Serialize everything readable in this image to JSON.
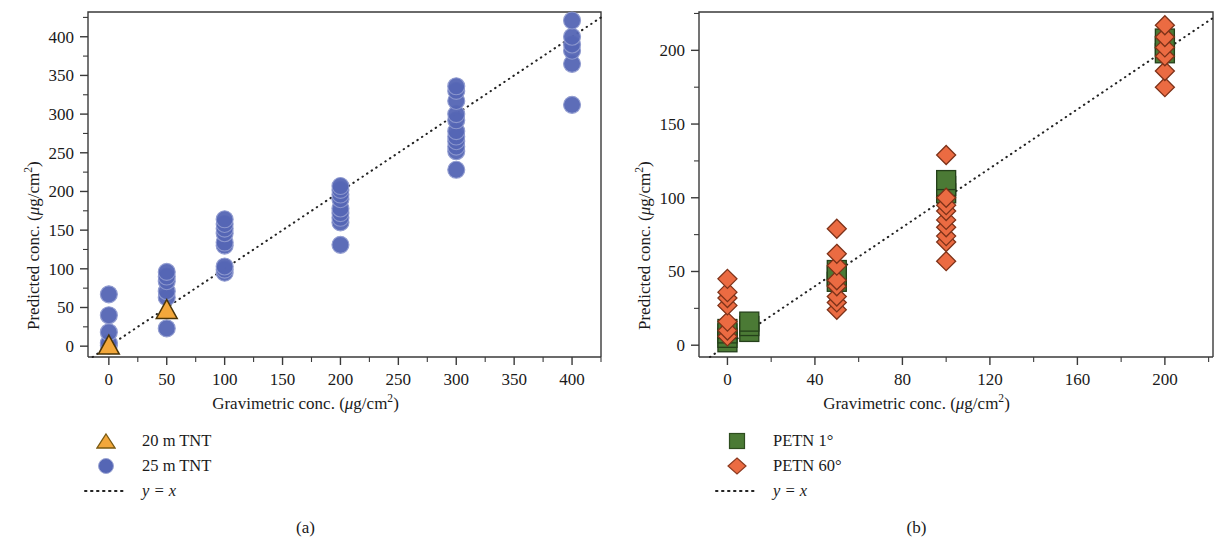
{
  "figure": {
    "panels": [
      {
        "id": "a",
        "caption": "(a)",
        "x_axis_label": "Gravimetric conc. (μg/cm²)",
        "y_axis_label": "Predicted conc. (μg/cm²)",
        "legend": [
          {
            "key": "triangle",
            "label": "20 m TNT",
            "color": "#F2A73B"
          },
          {
            "key": "circle",
            "label": "25 m TNT",
            "color": "#5566B5"
          },
          {
            "key": "dotted-line",
            "label": "y = x",
            "color": "#222222"
          }
        ]
      },
      {
        "id": "b",
        "caption": "(b)",
        "x_axis_label": "Gravimetric conc. (μg/cm²)",
        "y_axis_label": "Predicted conc. (μg/cm²)",
        "legend": [
          {
            "key": "square",
            "label": "PETN 1°",
            "color": "#4B7A35"
          },
          {
            "key": "diamond",
            "label": "PETN 60°",
            "color": "#EB6B42"
          },
          {
            "key": "dotted-line",
            "label": "y = x",
            "color": "#222222"
          }
        ]
      }
    ]
  },
  "chart_data": [
    {
      "type": "scatter",
      "panel": "a",
      "title": "",
      "xlabel": "Gravimetric conc. (μg/cm²)",
      "ylabel": "Predicted conc. (μg/cm²)",
      "xlim": [
        -18,
        425
      ],
      "ylim": [
        -14,
        432
      ],
      "xticks": [
        0,
        50,
        100,
        150,
        200,
        250,
        300,
        350,
        400
      ],
      "yticks": [
        0,
        50,
        100,
        150,
        200,
        250,
        300,
        350,
        400
      ],
      "xtick_minor_step": 25,
      "ytick_minor_step": 25,
      "grid": false,
      "legend_position": "below-left",
      "reference_line": {
        "label": "y = x",
        "style": "dotted",
        "slope": 1,
        "intercept": 0
      },
      "series": [
        {
          "name": "25 m TNT",
          "marker": "circle",
          "color": "#5566B5",
          "points": [
            [
              0,
              1
            ],
            [
              0,
              4
            ],
            [
              0,
              18
            ],
            [
              0,
              40
            ],
            [
              0,
              67
            ],
            [
              50,
              23
            ],
            [
              50,
              63
            ],
            [
              50,
              71
            ],
            [
              50,
              84
            ],
            [
              50,
              90
            ],
            [
              50,
              96
            ],
            [
              100,
              95
            ],
            [
              100,
              99
            ],
            [
              100,
              103
            ],
            [
              100,
              130
            ],
            [
              100,
              134
            ],
            [
              100,
              146
            ],
            [
              100,
              152
            ],
            [
              100,
              158
            ],
            [
              100,
              164
            ],
            [
              200,
              131
            ],
            [
              200,
              160
            ],
            [
              200,
              166
            ],
            [
              200,
              172
            ],
            [
              200,
              178
            ],
            [
              200,
              190
            ],
            [
              200,
              196
            ],
            [
              200,
              202
            ],
            [
              200,
              207
            ],
            [
              300,
              228
            ],
            [
              300,
              252
            ],
            [
              300,
              258
            ],
            [
              300,
              265
            ],
            [
              300,
              271
            ],
            [
              300,
              278
            ],
            [
              300,
              292
            ],
            [
              300,
              300
            ],
            [
              300,
              317
            ],
            [
              300,
              330
            ],
            [
              300,
              336
            ],
            [
              400,
              312
            ],
            [
              400,
              365
            ],
            [
              400,
              382
            ],
            [
              400,
              390
            ],
            [
              400,
              400
            ],
            [
              400,
              421
            ]
          ]
        },
        {
          "name": "20 m TNT",
          "marker": "triangle",
          "color": "#F2A73B",
          "points": [
            [
              0,
              0
            ],
            [
              50,
              46
            ]
          ]
        }
      ]
    },
    {
      "type": "scatter",
      "panel": "b",
      "title": "",
      "xlabel": "Gravimetric conc. (μg/cm²)",
      "ylabel": "Predicted conc. (μg/cm²)",
      "xlim": [
        -13,
        222
      ],
      "ylim": [
        -8,
        226
      ],
      "xticks": [
        0,
        40,
        80,
        120,
        160,
        200
      ],
      "yticks": [
        0,
        50,
        100,
        150,
        200
      ],
      "xtick_minor_step": 20,
      "ytick_minor_step": 25,
      "grid": false,
      "legend_position": "below-right",
      "reference_line": {
        "label": "y = x",
        "style": "dotted",
        "slope": 1,
        "intercept": 0
      },
      "series": [
        {
          "name": "PETN 1°",
          "marker": "square",
          "color": "#4B7A35",
          "points": [
            [
              0,
              2
            ],
            [
              0,
              5
            ],
            [
              0,
              8
            ],
            [
              0,
              11
            ],
            [
              10,
              9
            ],
            [
              10,
              13
            ],
            [
              10,
              16
            ],
            [
              50,
              43
            ],
            [
              50,
              47
            ],
            [
              50,
              51
            ],
            [
              100,
              103
            ],
            [
              100,
              108
            ],
            [
              100,
              112
            ],
            [
              200,
              198
            ],
            [
              200,
              203
            ],
            [
              200,
              208
            ]
          ]
        },
        {
          "name": "PETN 60°",
          "marker": "diamond",
          "color": "#EB6B42",
          "points": [
            [
              0,
              6
            ],
            [
              0,
              10
            ],
            [
              0,
              16
            ],
            [
              0,
              27
            ],
            [
              0,
              32
            ],
            [
              0,
              36
            ],
            [
              0,
              45
            ],
            [
              50,
              24
            ],
            [
              50,
              29
            ],
            [
              50,
              33
            ],
            [
              50,
              40
            ],
            [
              50,
              44
            ],
            [
              50,
              54
            ],
            [
              50,
              62
            ],
            [
              50,
              79
            ],
            [
              100,
              57
            ],
            [
              100,
              70
            ],
            [
              100,
              74
            ],
            [
              100,
              80
            ],
            [
              100,
              85
            ],
            [
              100,
              91
            ],
            [
              100,
              95
            ],
            [
              100,
              100
            ],
            [
              100,
              129
            ],
            [
              200,
              175
            ],
            [
              200,
              186
            ],
            [
              200,
              196
            ],
            [
              200,
              202
            ],
            [
              200,
              209
            ],
            [
              200,
              217
            ]
          ]
        }
      ]
    }
  ]
}
